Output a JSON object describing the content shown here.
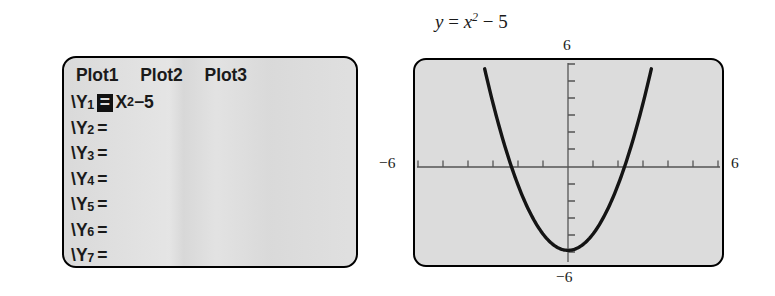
{
  "editor": {
    "plot_tabs": [
      {
        "label": "Plot1"
      },
      {
        "label": "Plot2"
      },
      {
        "label": "Plot3"
      }
    ],
    "rows": [
      {
        "slash": "\\",
        "name": "Y",
        "sub": "1",
        "eq": "=",
        "selected": true,
        "expr": "X",
        "exp": "2",
        "tail": "−5"
      },
      {
        "slash": "\\",
        "name": "Y",
        "sub": "2",
        "eq": "=",
        "selected": false,
        "expr": "",
        "exp": "",
        "tail": ""
      },
      {
        "slash": "\\",
        "name": "Y",
        "sub": "3",
        "eq": "=",
        "selected": false,
        "expr": "",
        "exp": "",
        "tail": ""
      },
      {
        "slash": "\\",
        "name": "Y",
        "sub": "4",
        "eq": "=",
        "selected": false,
        "expr": "",
        "exp": "",
        "tail": ""
      },
      {
        "slash": "\\",
        "name": "Y",
        "sub": "5",
        "eq": "=",
        "selected": false,
        "expr": "",
        "exp": "",
        "tail": ""
      },
      {
        "slash": "\\",
        "name": "Y",
        "sub": "6",
        "eq": "=",
        "selected": false,
        "expr": "",
        "exp": "",
        "tail": ""
      },
      {
        "slash": "\\",
        "name": "Y",
        "sub": "7",
        "eq": "=",
        "selected": false,
        "expr": "",
        "exp": "",
        "tail": ""
      }
    ]
  },
  "graph": {
    "title_y": "y",
    "title_eq": "=",
    "title_x": "x",
    "title_exp": "2",
    "title_tail": "− 5",
    "label_ymax": "6",
    "label_xmin": "−6",
    "label_xmax": "6",
    "label_ymin": "−6"
  },
  "chart_data": {
    "type": "line",
    "xlabel": "x",
    "ylabel": "y",
    "xlim": [
      -6,
      6
    ],
    "ylim": [
      -6,
      6
    ],
    "xtick_step": 1,
    "ytick_step": 1,
    "grid": false,
    "legend": "none",
    "axis_tick_labels": {
      "left": "-6",
      "right": "6",
      "top": "6",
      "bottom": "-6"
    },
    "series": [
      {
        "name": "y = x^2 - 5",
        "equation": "y = x^2 - 5",
        "color": "#141414",
        "vertex": [
          0,
          -5
        ],
        "x_intercepts": [
          -2.236,
          2.236
        ],
        "y_intercept": -5,
        "x": [
          -3.317,
          -3.0,
          -2.75,
          -2.5,
          -2.236,
          -2.0,
          -1.75,
          -1.5,
          -1.25,
          -1.0,
          -0.75,
          -0.5,
          -0.25,
          0,
          0.25,
          0.5,
          0.75,
          1.0,
          1.25,
          1.5,
          1.75,
          2.0,
          2.236,
          2.5,
          2.75,
          3.0,
          3.317
        ],
        "y": [
          6.0,
          4.0,
          2.5625,
          1.25,
          0,
          -1.0,
          -1.9375,
          -2.75,
          -3.4375,
          -4.0,
          -4.4375,
          -4.75,
          -4.9375,
          -5.0,
          -4.9375,
          -4.75,
          -4.4375,
          -4.0,
          -3.4375,
          -2.75,
          -1.9375,
          -1.0,
          0,
          1.25,
          2.5625,
          4.0,
          6.0
        ]
      }
    ]
  }
}
